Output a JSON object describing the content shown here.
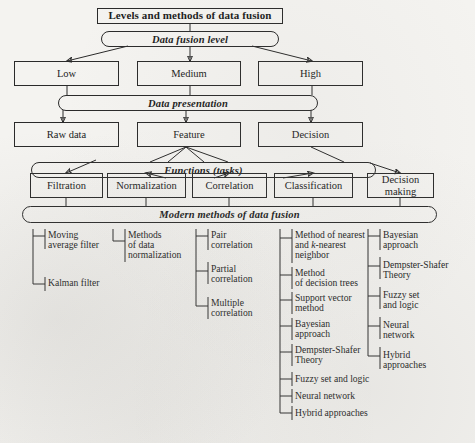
{
  "figure": {
    "title": "Levels and methods of data fusion",
    "type": "hierarchical-block-diagram"
  },
  "root": {
    "label": "Levels and methods of data fusion"
  },
  "bands": {
    "fusion_level": "Data fusion level",
    "data_presentation": "Data presentation",
    "functions_italic": "Functions",
    "functions_paren": "(tasks)",
    "modern_methods": "Modern methods of data fusion"
  },
  "levels": [
    {
      "label": "Low"
    },
    {
      "label": "Medium"
    },
    {
      "label": "High"
    }
  ],
  "presentation": [
    {
      "label": "Raw data"
    },
    {
      "label": "Feature"
    },
    {
      "label": "Decision"
    }
  ],
  "functions": [
    {
      "label": "Filtration"
    },
    {
      "label": "Normalization"
    },
    {
      "label": "Correlation"
    },
    {
      "label": "Classification"
    },
    {
      "label": "Decision\nmaking"
    }
  ],
  "methods": {
    "filtration": [
      "Moving\naverage filter",
      "Kalman filter"
    ],
    "normalization": [
      "Methods\nof data\nnormalization"
    ],
    "correlation": [
      "Pair\ncorrelation",
      "Partial\ncorrelation",
      "Multiple\ncorrelation"
    ],
    "classification": [
      "Method of nearest\nand k-nearest\nneighbor",
      "Method\nof decision trees",
      "Support vector\nmethod",
      "Bayesian\napproach",
      "Dempster-Shafer\nTheory",
      "Fuzzy set and logic",
      "Neural network",
      "Hybrid approaches"
    ],
    "decision_making": [
      "Bayesian\napproach",
      "Dempster-Shafer\nTheory",
      "Fuzzy set\nand logic",
      "Neural\nnetwork",
      "Hybrid\napproaches"
    ]
  },
  "colors": {
    "ink": "#2a2a2a",
    "paper": "#f4f3f0"
  }
}
